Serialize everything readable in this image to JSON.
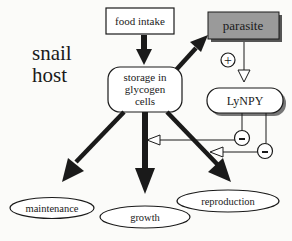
{
  "title": {
    "line1": "snail",
    "line2": "host"
  },
  "nodes": {
    "food_intake": "food intake",
    "parasite": "parasite",
    "storage": {
      "line1": "storage in",
      "line2": "glycogen",
      "line3": "cells"
    },
    "lynpy": "LyNPY",
    "maintenance": "maintenance",
    "growth": "growth",
    "reproduction": "reproduction"
  },
  "signs": {
    "plus": "+",
    "minus1": "-",
    "minus2": "-"
  },
  "colors": {
    "parasite_fill": "#9a9a9a",
    "ink": "#1a1a1a",
    "background": "#fbfbf9"
  }
}
